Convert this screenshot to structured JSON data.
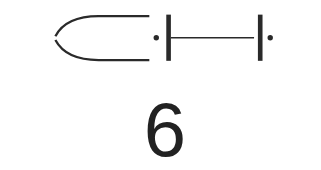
{
  "diagram": {
    "stroke_color": "#2a2a2a",
    "elements": [
      {
        "name": "open-curve-bracket",
        "type": "curve"
      },
      {
        "name": "dot-left",
        "type": "dot"
      },
      {
        "name": "bar-left",
        "type": "vertical-bar"
      },
      {
        "name": "connector-line",
        "type": "horizontal-line"
      },
      {
        "name": "bar-right",
        "type": "vertical-bar"
      },
      {
        "name": "dot-right",
        "type": "dot"
      }
    ]
  },
  "label": {
    "text": "6"
  }
}
